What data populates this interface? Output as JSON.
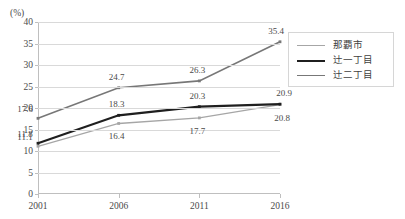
{
  "chart_data": {
    "type": "line",
    "title": "",
    "xlabel": "",
    "ylabel": "(%)",
    "unit_label": "(%)",
    "categories": [
      "2001",
      "2006",
      "2011",
      "2016"
    ],
    "ylim": [
      0,
      40
    ],
    "ytick_step": 5,
    "yticks": [
      "40",
      "35",
      "30",
      "25",
      "20",
      "15",
      "10",
      "5",
      "0"
    ],
    "grid": true,
    "legend_position": "right",
    "series": [
      {
        "name": "那覇市",
        "color": "#a6a6a6",
        "width": 1.3,
        "values": [
          11.1,
          16.4,
          17.7,
          20.8
        ],
        "labels": [
          "11.1",
          "16.4",
          "17.7",
          "20.8"
        ]
      },
      {
        "name": "辻一丁目",
        "color": "#1f1f1f",
        "width": 2.2,
        "values": [
          11.8,
          18.3,
          20.3,
          20.9
        ],
        "labels": [
          "11.8",
          "18.3",
          "20.3",
          "20.9"
        ]
      },
      {
        "name": "辻二丁目",
        "color": "#777777",
        "width": 1.6,
        "values": [
          17.6,
          24.7,
          26.3,
          35.4
        ],
        "labels": [
          "17.6",
          "24.7",
          "26.3",
          "35.4"
        ]
      }
    ]
  }
}
